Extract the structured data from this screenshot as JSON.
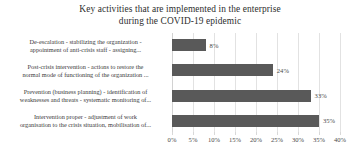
{
  "chart_data": {
    "type": "bar",
    "orientation": "horizontal",
    "title": "Key activities that are implemented in the enterprise during the COVID-19 epidemic",
    "title_lines": [
      "Key activities that are implemented in the enterprise",
      "during the COVID-19 epidemic"
    ],
    "categories": [
      "De-escalation - stabilizing the organization - appointment of anti-crisis staff - assigning...",
      "Post-crisis intervention - actions to restore the normal mode of functioning of the organization ...",
      "Prevention (business planning) - identification of weaknesses and threats - systematic monitoring of...",
      "Intervention proper - adjustment of work organisation to the crisis situation, mobilisation of..."
    ],
    "category_lines": [
      [
        "De-escalation - stabilizing the organization -",
        "appointment of anti-crisis staff - assigning..."
      ],
      [
        "Post-crisis intervention - actions to restore the",
        "normal mode of functioning of the organization ..."
      ],
      [
        "Prevention (business planning) - identification of",
        "weaknesses and threats - systematic monitoring of..."
      ],
      [
        "Intervention proper - adjustment of work",
        "organisation to the crisis situation, mobilisation of..."
      ]
    ],
    "values": [
      8,
      24,
      33,
      35
    ],
    "value_labels": [
      "8%",
      "24%",
      "33%",
      "35%"
    ],
    "xlabel": "",
    "ylabel": "",
    "xlim": [
      0,
      40
    ],
    "xticks": [
      0,
      5,
      10,
      15,
      20,
      25,
      30,
      35,
      40
    ],
    "xtick_labels": [
      "0%",
      "5%",
      "10%",
      "15%",
      "20%",
      "25%",
      "30%",
      "35%",
      "40%"
    ],
    "grid": "vertical",
    "legend": "none",
    "bar_color": "#595959",
    "gridline_color": "#e2e2e2",
    "background_color": "#ffffff",
    "text_color": "#3a3a3a"
  }
}
